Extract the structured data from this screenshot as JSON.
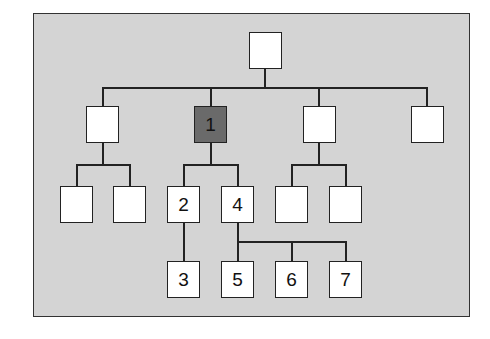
{
  "diagram": {
    "type": "tree",
    "colors": {
      "background": "#d4d4d4",
      "node": "#ffffff",
      "highlight": "#6a6a6a",
      "line": "#222222"
    },
    "nodes": {
      "root": {
        "label": ""
      },
      "l1_a": {
        "label": ""
      },
      "l1_b": {
        "label": "1",
        "highlighted": true
      },
      "l1_c": {
        "label": ""
      },
      "l1_d": {
        "label": ""
      },
      "l2_a1": {
        "label": ""
      },
      "l2_a2": {
        "label": ""
      },
      "l2_b1": {
        "label": "2"
      },
      "l2_b2": {
        "label": "4"
      },
      "l2_c1": {
        "label": ""
      },
      "l2_c2": {
        "label": ""
      },
      "l3_2a": {
        "label": "3"
      },
      "l3_4a": {
        "label": "5"
      },
      "l3_4b": {
        "label": "6"
      },
      "l3_4c": {
        "label": "7"
      }
    }
  }
}
